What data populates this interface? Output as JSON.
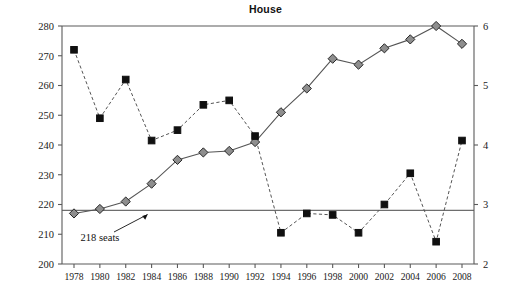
{
  "chart_data": {
    "type": "line",
    "title": "House",
    "xlabel": "",
    "ylabel": "",
    "grid": false,
    "legend_position": "none",
    "x": [
      1978,
      1980,
      1982,
      1984,
      1986,
      1988,
      1990,
      1992,
      1994,
      1996,
      1998,
      2000,
      2002,
      2004,
      2006,
      2008
    ],
    "xtick_labels": [
      "1978",
      "1980",
      "1982",
      "1984",
      "1986",
      "1988",
      "1990",
      "1992",
      "1994",
      "1996",
      "1998",
      "2000",
      "2002",
      "2004",
      "2006",
      "2008"
    ],
    "left_axis": {
      "ylim": [
        200,
        280
      ],
      "ticks": [
        200,
        210,
        220,
        230,
        240,
        250,
        260,
        270,
        280
      ],
      "tick_labels": [
        "200",
        "210",
        "220",
        "230",
        "240",
        "250",
        "260",
        "270",
        "280"
      ]
    },
    "right_axis": {
      "ylim": [
        2,
        6
      ],
      "ticks": [
        2,
        3,
        4,
        5,
        6
      ],
      "tick_labels": [
        "2",
        "3",
        "4",
        "5",
        "6"
      ]
    },
    "reference_lines": [
      {
        "name": "218-seats-line",
        "axis": "left",
        "value": 218,
        "label": "218 seats"
      }
    ],
    "annotations": [
      {
        "name": "218-seats-annotation",
        "text": "218 seats",
        "points_to_year": 1984,
        "points_to_value": 218,
        "axis": "left"
      }
    ],
    "series": [
      {
        "name": "diamond-series",
        "marker": "diamond",
        "line_style": "solid",
        "axis": "left",
        "color": "#8e8e8e",
        "values": [
          217,
          218.5,
          221,
          227,
          235,
          237.5,
          238,
          241,
          251,
          259,
          269,
          267,
          272.5,
          275.5,
          280,
          274
        ]
      },
      {
        "name": "square-series",
        "marker": "square",
        "line_style": "dashed",
        "axis": "left",
        "color": "#101010",
        "values": [
          272,
          249,
          262,
          241.5,
          245,
          253.5,
          255,
          243,
          210.5,
          217,
          216.5,
          210.5,
          220,
          230.5,
          207.5,
          241.5
        ]
      }
    ]
  },
  "colors": {
    "axis": "#5a5a5a",
    "reference_line": "#6e6e6e",
    "diamond_fill": "#8e8e8e",
    "square_fill": "#101010",
    "line": "#555555",
    "background": "#ffffff"
  }
}
